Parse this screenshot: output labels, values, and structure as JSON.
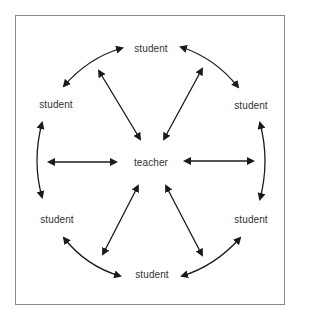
{
  "diagram": {
    "center": {
      "label": "teacher",
      "x": 151,
      "y": 162
    },
    "nodes": [
      {
        "id": "top",
        "label": "student",
        "x": 151,
        "y": 48
      },
      {
        "id": "upper-right",
        "label": "student",
        "x": 251,
        "y": 105
      },
      {
        "id": "lower-right",
        "label": "student",
        "x": 251,
        "y": 219
      },
      {
        "id": "bottom",
        "label": "student",
        "x": 152,
        "y": 274
      },
      {
        "id": "lower-left",
        "label": "student",
        "x": 57,
        "y": 219
      },
      {
        "id": "upper-left",
        "label": "student",
        "x": 56,
        "y": 104
      }
    ],
    "edges": [
      {
        "from": "teacher",
        "to": "top"
      },
      {
        "from": "teacher",
        "to": "upper-right"
      },
      {
        "from": "teacher",
        "to": "lower-right"
      },
      {
        "from": "teacher",
        "to": "bottom"
      },
      {
        "from": "teacher",
        "to": "lower-left"
      },
      {
        "from": "teacher",
        "to": "upper-left"
      },
      {
        "from": "upper-left",
        "to": "top"
      },
      {
        "from": "top",
        "to": "upper-right"
      },
      {
        "from": "upper-right",
        "to": "lower-right"
      },
      {
        "from": "lower-right",
        "to": "bottom"
      },
      {
        "from": "bottom",
        "to": "lower-left"
      },
      {
        "from": "lower-left",
        "to": "upper-left"
      }
    ],
    "colors": {
      "arrow": "#1a1a1a",
      "text": "#333333",
      "frame": "#8a8a8a"
    }
  }
}
